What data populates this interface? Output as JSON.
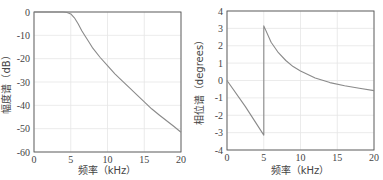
{
  "chart_data": [
    {
      "type": "line",
      "title": "",
      "xlabel": "频率（kHz）",
      "ylabel": "幅度谱（dB）",
      "xlim": [
        0,
        20
      ],
      "ylim": [
        -60,
        0
      ],
      "xticks": [
        0,
        5,
        10,
        15,
        20
      ],
      "yticks": [
        0,
        -10,
        -20,
        -30,
        -40,
        -50,
        -60
      ],
      "grid": true,
      "series": [
        {
          "name": "magnitude",
          "x": [
            0,
            2,
            4,
            4.5,
            5,
            5.5,
            6,
            6.5,
            7,
            7.5,
            8,
            9,
            10,
            11,
            12,
            13,
            14,
            15,
            16,
            17,
            18,
            19,
            20
          ],
          "y": [
            0,
            0,
            0,
            -0.2,
            -0.8,
            -2.5,
            -5,
            -8,
            -10.5,
            -13,
            -15.5,
            -19.5,
            -23,
            -26.5,
            -29.5,
            -32.5,
            -35.5,
            -38.5,
            -41.5,
            -44,
            -46.5,
            -49,
            -51.5
          ]
        }
      ]
    },
    {
      "type": "line",
      "title": "",
      "xlabel": "频率（kHz）",
      "ylabel": "相位谱（degrees）",
      "xlim": [
        0,
        20
      ],
      "ylim": [
        -4,
        4
      ],
      "xticks": [
        0,
        5,
        10,
        15,
        20
      ],
      "yticks": [
        4,
        3,
        2,
        1,
        0,
        -1,
        -2,
        -3,
        -4
      ],
      "grid": true,
      "series": [
        {
          "name": "phase",
          "x": [
            0,
            2.5,
            5,
            5,
            6,
            7,
            8,
            9,
            10,
            12,
            14,
            16,
            18,
            20
          ],
          "y": [
            0,
            -1.5,
            -3.14,
            3.14,
            2.2,
            1.6,
            1.15,
            0.8,
            0.55,
            0.15,
            -0.12,
            -0.3,
            -0.45,
            -0.58
          ]
        }
      ]
    }
  ],
  "colors": {
    "line": "#8a8a8a",
    "axis": "#555555",
    "grid": "#e6e6e6"
  }
}
